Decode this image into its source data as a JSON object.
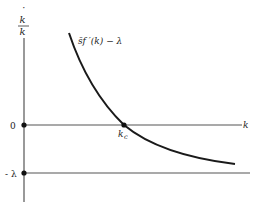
{
  "diagram": {
    "type": "economic-growth-phase-diagram",
    "y_axis": {
      "label_numerator": "k",
      "label_denominator": "k",
      "label_dot": "˙",
      "ticks": [
        {
          "label": "0",
          "y_value": 0
        },
        {
          "label": "- λ",
          "y_value": -1
        }
      ]
    },
    "x_axis": {
      "label": "k"
    },
    "curve": {
      "label": "s̄f ′(k) − λ",
      "description": "downward-sloping convex curve crossing zero at k_c"
    },
    "points": [
      {
        "name": "origin-zero",
        "label": "0"
      },
      {
        "name": "minus-lambda",
        "label": "- λ"
      },
      {
        "name": "k-c",
        "label_main": "k",
        "label_sub": "c"
      }
    ],
    "horizontal_lines": [
      {
        "name": "zero-line",
        "label": "k"
      },
      {
        "name": "minus-lambda-line",
        "label": ""
      }
    ]
  }
}
